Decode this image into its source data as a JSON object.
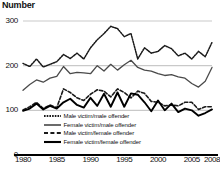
{
  "chart_data": {
    "type": "line",
    "title": "Number",
    "xlabel": "",
    "ylabel": "Number",
    "ylim": [
      0,
      300
    ],
    "xlim": [
      1980,
      2008
    ],
    "grid": true,
    "gridlines": [
      100,
      200,
      300
    ],
    "legend_position": "inside-bottom-left",
    "ytick_labels": [
      "0",
      "100",
      "200",
      "300"
    ],
    "ytick_values": [
      0,
      100,
      200,
      300
    ],
    "xtick_labels": [
      "1980",
      "1985",
      "1990",
      "1995",
      "2000",
      "2005",
      "2008"
    ],
    "xtick_values": [
      1980,
      1985,
      1990,
      1995,
      2000,
      2005,
      2008
    ],
    "x": [
      1980,
      1981,
      1982,
      1983,
      1984,
      1985,
      1986,
      1987,
      1988,
      1989,
      1990,
      1991,
      1992,
      1993,
      1994,
      1995,
      1996,
      1997,
      1998,
      1999,
      2000,
      2001,
      2002,
      2003,
      2004,
      2005,
      2006,
      2007,
      2008
    ],
    "series": [
      {
        "name": "Male victim/male offender",
        "style": "dotted",
        "color": "#1a1a1a",
        "values": [
          205,
          198,
          215,
          197,
          203,
          209,
          225,
          216,
          228,
          215,
          240,
          258,
          272,
          288,
          283,
          265,
          272,
          215,
          240,
          228,
          232,
          245,
          238,
          222,
          228,
          215,
          232,
          220,
          252
        ]
      },
      {
        "name": "Female victim/male offender",
        "style": "solid-thin",
        "color": "#4a4a4a",
        "values": [
          145,
          158,
          168,
          163,
          172,
          176,
          198,
          182,
          185,
          184,
          182,
          200,
          188,
          203,
          190,
          202,
          212,
          196,
          190,
          188,
          182,
          178,
          180,
          175,
          172,
          160,
          152,
          165,
          196
        ]
      },
      {
        "name": "Male victim/female offender",
        "style": "dashed",
        "color": "#1a1a1a",
        "values": [
          101,
          108,
          118,
          104,
          112,
          106,
          148,
          140,
          128,
          122,
          136,
          146,
          143,
          130,
          148,
          140,
          128,
          143,
          138,
          120,
          118,
          110,
          112,
          110,
          118,
          118,
          102,
          108,
          108
        ]
      },
      {
        "name": "Female victim/female offender",
        "style": "solid-thick",
        "color": "#000000",
        "values": [
          99,
          104,
          115,
          102,
          110,
          104,
          118,
          126,
          112,
          106,
          128,
          110,
          137,
          108,
          140,
          108,
          138,
          135,
          118,
          98,
          122,
          100,
          115,
          96,
          104,
          100,
          88,
          94,
          102
        ]
      }
    ],
    "footnote": ""
  },
  "axis": {
    "y_title": "Number"
  },
  "legend": {
    "items": [
      {
        "label": "Male victim/male offender"
      },
      {
        "label": "Female victim/male offender"
      },
      {
        "label": "Male victim/female offender"
      },
      {
        "label": "Female victim/female offender"
      }
    ]
  }
}
